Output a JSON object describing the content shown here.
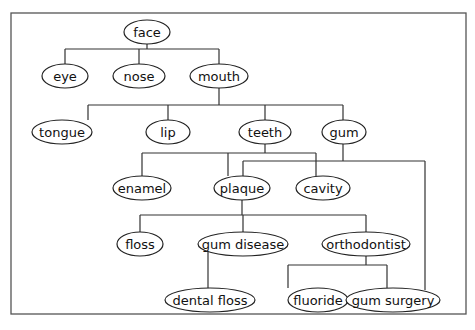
{
  "diagram": {
    "type": "concept-tree",
    "nodes": [
      {
        "id": "face",
        "label": "face"
      },
      {
        "id": "eye",
        "label": "eye"
      },
      {
        "id": "nose",
        "label": "nose"
      },
      {
        "id": "mouth",
        "label": "mouth"
      },
      {
        "id": "tongue",
        "label": "tongue"
      },
      {
        "id": "lip",
        "label": "lip"
      },
      {
        "id": "teeth",
        "label": "teeth"
      },
      {
        "id": "gum",
        "label": "gum"
      },
      {
        "id": "enamel",
        "label": "enamel"
      },
      {
        "id": "plaque",
        "label": "plaque"
      },
      {
        "id": "cavity",
        "label": "cavity"
      },
      {
        "id": "floss",
        "label": "floss"
      },
      {
        "id": "gum_disease",
        "label": "gum disease"
      },
      {
        "id": "orthodontist",
        "label": "orthodontist"
      },
      {
        "id": "dental_floss",
        "label": "dental floss"
      },
      {
        "id": "fluoride",
        "label": "fluoride"
      },
      {
        "id": "gum_surgery",
        "label": "gum surgery"
      }
    ],
    "edges": [
      {
        "from": "face",
        "to": "eye"
      },
      {
        "from": "face",
        "to": "nose"
      },
      {
        "from": "face",
        "to": "mouth"
      },
      {
        "from": "mouth",
        "to": "tongue"
      },
      {
        "from": "mouth",
        "to": "lip"
      },
      {
        "from": "mouth",
        "to": "teeth"
      },
      {
        "from": "mouth",
        "to": "gum"
      },
      {
        "from": "teeth",
        "to": "enamel"
      },
      {
        "from": "teeth",
        "to": "plaque"
      },
      {
        "from": "teeth",
        "to": "cavity"
      },
      {
        "from": "gum",
        "to": "plaque"
      },
      {
        "from": "gum",
        "to": "gum_surgery"
      },
      {
        "from": "plaque",
        "to": "floss"
      },
      {
        "from": "plaque",
        "to": "gum_disease"
      },
      {
        "from": "plaque",
        "to": "orthodontist"
      },
      {
        "from": "gum_disease",
        "to": "dental_floss"
      },
      {
        "from": "orthodontist",
        "to": "fluoride"
      },
      {
        "from": "orthodontist",
        "to": "gum_surgery"
      }
    ]
  }
}
